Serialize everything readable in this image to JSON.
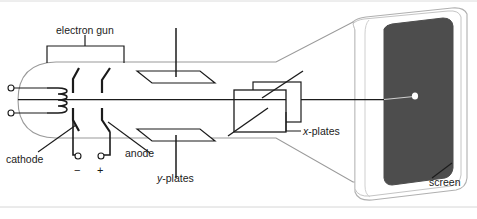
{
  "figure": {
    "title_alt": "cathode ray tube cross-section diagram",
    "background_color": "#ffffff",
    "line_color": "#1b1b1b",
    "envelope_outline_color": "#8a8a8a",
    "screen_color": "#4d4d4d",
    "spot_color": "#ffffff",
    "border_color": "#d8d8d8"
  },
  "labels": {
    "electron_gun": "electron gun",
    "cathode": "cathode",
    "anode": "anode",
    "y_plates_prefix": "y",
    "y_plates_suffix": "-plates",
    "x_plates_prefix": "x",
    "x_plates_suffix": "-plates",
    "screen": "screen",
    "minus": "−",
    "plus": "+"
  },
  "components": [
    {
      "name": "electron-gun",
      "label": "electron gun"
    },
    {
      "name": "cathode",
      "label": "cathode"
    },
    {
      "name": "heater-filament",
      "label": ""
    },
    {
      "name": "anode",
      "label": "anode"
    },
    {
      "name": "y-plates",
      "label": "y-plates"
    },
    {
      "name": "x-plates",
      "label": "x-plates"
    },
    {
      "name": "screen",
      "label": "screen"
    },
    {
      "name": "electron-beam",
      "label": ""
    },
    {
      "name": "negative-terminal",
      "label": "−"
    },
    {
      "name": "positive-terminal",
      "label": "+"
    }
  ]
}
